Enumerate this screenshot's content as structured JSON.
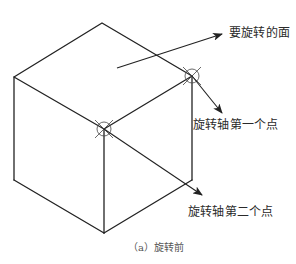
{
  "figure": {
    "type": "isometric-cube-rotation-diagram",
    "caption": "（a）旋转前",
    "colors": {
      "line": "#222222",
      "marker": "#444444",
      "text": "#2a2a2a",
      "caption": "#555555",
      "background": "#ffffff"
    },
    "labels": {
      "face_to_rotate": "要旋转的面",
      "axis_point_1": "旋转轴第一个点",
      "axis_point_2": "旋转轴第二个点"
    },
    "cube": {
      "vertices": {
        "top": [
          102,
          23
        ],
        "left": [
          14,
          77
        ],
        "right": [
          192,
          76
        ],
        "front": [
          104,
          129
        ],
        "bottom_left": [
          14,
          180
        ],
        "bottom_right": [
          192,
          180
        ],
        "bottom_front": [
          104,
          233
        ]
      }
    },
    "markers": [
      {
        "name": "axis-point-1-marker",
        "center": [
          192,
          76
        ],
        "radius": 7
      },
      {
        "name": "axis-point-2-marker",
        "center": [
          104,
          129
        ],
        "radius": 7
      }
    ],
    "arrows": [
      {
        "name": "face-arrow",
        "from": [
          117,
          68
        ],
        "to": [
          222,
          34
        ]
      },
      {
        "name": "axis-point-1-arrow",
        "from": [
          192,
          76
        ],
        "to": [
          222,
          113
        ]
      },
      {
        "name": "axis-point-2-arrow",
        "from": [
          104,
          129
        ],
        "to": [
          202,
          195
        ]
      }
    ]
  }
}
